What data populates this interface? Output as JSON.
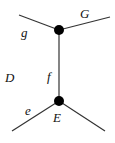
{
  "diagram": {
    "labels": {
      "g": "g",
      "G": "G",
      "D": "D",
      "f": "f",
      "e": "e",
      "E": "E"
    },
    "colors": {
      "line": "#333333",
      "node": "#000000"
    }
  }
}
